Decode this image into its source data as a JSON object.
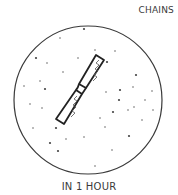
{
  "diagram": {
    "title": "CHAINS",
    "caption": "IN 1 HOUR",
    "field": {
      "cx": 88,
      "cy": 100,
      "r": 74,
      "stroke": "#3a3a3a"
    },
    "chromosome": {
      "label": "chromosome chain",
      "stroke": "#222222",
      "upper_arm": "M96,55 L104,60 L86,88 L79,84 Z",
      "lower_arm": "M76,90 L82,94 L64,124 L56,119 Z"
    },
    "dots": [
      [
        84,
        29
      ],
      [
        60,
        38
      ],
      [
        115,
        51
      ],
      [
        36,
        58
      ],
      [
        47,
        63
      ],
      [
        95,
        50
      ],
      [
        107,
        62
      ],
      [
        63,
        72
      ],
      [
        24,
        86
      ],
      [
        45,
        89
      ],
      [
        40,
        81
      ],
      [
        106,
        92
      ],
      [
        120,
        90
      ],
      [
        133,
        87
      ],
      [
        152,
        91
      ],
      [
        119,
        100
      ],
      [
        145,
        100
      ],
      [
        134,
        107
      ],
      [
        113,
        112
      ],
      [
        128,
        110
      ],
      [
        105,
        127
      ],
      [
        129,
        136
      ],
      [
        84,
        137
      ],
      [
        33,
        128
      ],
      [
        56,
        128
      ],
      [
        30,
        104
      ],
      [
        42,
        108
      ],
      [
        70,
        112
      ],
      [
        112,
        150
      ],
      [
        95,
        166
      ],
      [
        58,
        151
      ],
      [
        66,
        139
      ],
      [
        142,
        120
      ],
      [
        136,
        75
      ],
      [
        78,
        58
      ],
      [
        100,
        118
      ],
      [
        50,
        143
      ],
      [
        153,
        110
      ]
    ]
  }
}
